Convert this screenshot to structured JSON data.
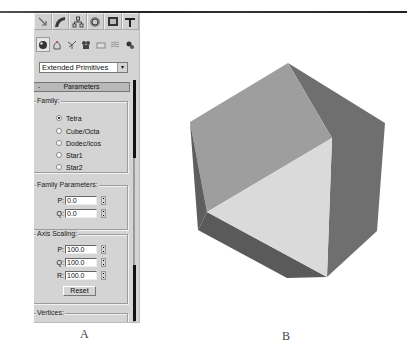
{
  "figure": {
    "caption_a": "A",
    "caption_b": "B"
  },
  "panel": {
    "tabs": [
      {
        "name": "create",
        "icon": "create-icon"
      },
      {
        "name": "modify",
        "icon": "modify-icon"
      },
      {
        "name": "hierarchy",
        "icon": "hierarchy-icon"
      },
      {
        "name": "motion",
        "icon": "motion-icon"
      },
      {
        "name": "display",
        "icon": "display-icon"
      },
      {
        "name": "utilities",
        "icon": "utilities-icon"
      }
    ],
    "categories": [
      {
        "name": "geometry",
        "icon": "geometry-icon",
        "active": true
      },
      {
        "name": "shapes",
        "icon": "shapes-icon"
      },
      {
        "name": "lights",
        "icon": "lights-icon"
      },
      {
        "name": "cameras",
        "icon": "cameras-icon"
      },
      {
        "name": "helpers",
        "icon": "helpers-icon"
      },
      {
        "name": "space-warps",
        "icon": "space-warps-icon"
      },
      {
        "name": "systems",
        "icon": "systems-icon"
      }
    ],
    "dropdown": {
      "selected": "Extended Primitives",
      "arrow": "▾"
    },
    "rollout": {
      "toggle": "-",
      "title": "Parameters"
    },
    "family": {
      "label": "Family:",
      "options": [
        "Tetra",
        "Cube/Octa",
        "Dodec/Icos",
        "Star1",
        "Star2"
      ],
      "selected": "Tetra"
    },
    "family_parameters": {
      "label": "Family Parameters:",
      "fields": [
        {
          "label": "P:",
          "value": "0.0"
        },
        {
          "label": "Q:",
          "value": "0.0"
        }
      ]
    },
    "axis_scaling": {
      "label": "Axis Scaling:",
      "fields": [
        {
          "label": "P:",
          "value": "100.0"
        },
        {
          "label": "Q:",
          "value": "100.0"
        },
        {
          "label": "R:",
          "value": "100.0"
        }
      ],
      "reset_label": "Reset"
    },
    "vertices": {
      "label": "Vertices:"
    }
  },
  "render": {
    "colors": {
      "top_face": "#9c9c9c",
      "front_face": "#d9d9d9",
      "right_face": "#6f6f6f",
      "bottom_face": "#5a5a5a",
      "left_sliver": "#606060"
    }
  }
}
